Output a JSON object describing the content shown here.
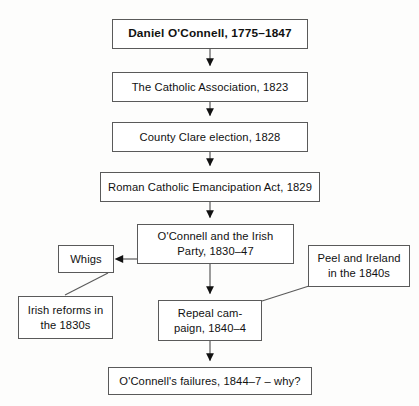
{
  "diagram": {
    "title": "Daniel O'Connell, 1775–1847",
    "stroke_color": "#5a5a5a",
    "text_color": "#111111",
    "background_color": "#fdfdfc",
    "nodes": [
      {
        "id": "daniel",
        "label": "Daniel O'Connell, 1775–1847",
        "lines": [
          "Daniel O'Connell, 1775–1847"
        ],
        "bold": true
      },
      {
        "id": "assoc",
        "label": "The Catholic Association, 1823",
        "lines": [
          "The Catholic Association, 1823"
        ],
        "bold": false
      },
      {
        "id": "clare",
        "label": "County Clare election, 1828",
        "lines": [
          "County Clare election, 1828"
        ],
        "bold": false
      },
      {
        "id": "emancip",
        "label": "Roman Catholic Emancipation Act, 1829",
        "lines": [
          "Roman Catholic Emancipation Act, 1829"
        ],
        "bold": false
      },
      {
        "id": "party",
        "label": "O'Connell and the Irish Party, 1830–47",
        "lines": [
          "O'Connell and the Irish",
          "Party, 1830–47"
        ],
        "bold": false
      },
      {
        "id": "whigs",
        "label": "Whigs",
        "lines": [
          "Whigs"
        ],
        "bold": false
      },
      {
        "id": "peel",
        "label": "Peel and Ireland in the 1840s",
        "lines": [
          "Peel and Ireland",
          "in the 1840s"
        ],
        "bold": false
      },
      {
        "id": "reforms",
        "label": "Irish reforms in the 1830s",
        "lines": [
          "Irish reforms in",
          "the 1830s"
        ],
        "bold": false
      },
      {
        "id": "repeal",
        "label": "Repeal campaign, 1840–4",
        "lines": [
          "Repeal cam-",
          "paign, 1840–4"
        ],
        "bold": false
      },
      {
        "id": "failures",
        "label": "O'Connell's failures, 1844–7 – why?",
        "lines": [
          "O'Connell's failures, 1844–7 – why?"
        ],
        "bold": false
      }
    ],
    "edges": [
      {
        "from": "daniel",
        "to": "assoc",
        "style": "arrow",
        "direction": "down"
      },
      {
        "from": "assoc",
        "to": "clare",
        "style": "arrow",
        "direction": "down"
      },
      {
        "from": "clare",
        "to": "emancip",
        "style": "arrow",
        "direction": "down"
      },
      {
        "from": "emancip",
        "to": "party",
        "style": "arrow",
        "direction": "down"
      },
      {
        "from": "party",
        "to": "whigs",
        "style": "arrow",
        "direction": "left"
      },
      {
        "from": "party",
        "to": "repeal",
        "style": "arrow",
        "direction": "down"
      },
      {
        "from": "whigs",
        "to": "reforms",
        "style": "plain-line",
        "direction": "diagonal"
      },
      {
        "from": "peel",
        "to": "repeal",
        "style": "plain-line",
        "direction": "diagonal"
      },
      {
        "from": "repeal",
        "to": "failures",
        "style": "arrow",
        "direction": "down"
      }
    ]
  },
  "labels": {
    "n_daniel_l1": "Daniel O'Connell, 1775–1847",
    "n_assoc_l1": "The Catholic Association, 1823",
    "n_clare_l1": "County Clare election, 1828",
    "n_emancip_l1": "Roman Catholic Emancipation Act, 1829",
    "n_party_l1": "O'Connell and the Irish",
    "n_party_l2": "Party, 1830–47",
    "n_whigs_l1": "Whigs",
    "n_peel_l1": "Peel and Ireland",
    "n_peel_l2": "in the 1840s",
    "n_reforms_l1": "Irish reforms in",
    "n_reforms_l2": "the 1830s",
    "n_repeal_l1": "Repeal cam-",
    "n_repeal_l2": "paign, 1840–4",
    "n_failures_l1": "O'Connell's failures, 1844–7 – why?"
  }
}
